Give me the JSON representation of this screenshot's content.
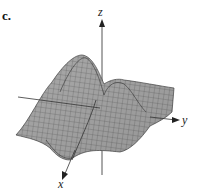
{
  "figure": {
    "panel_label": "c.",
    "axes": {
      "x": "x",
      "y": "y",
      "z": "z"
    },
    "surface_color": "#a6a6a6",
    "mesh_color": "#4a4a4a"
  }
}
